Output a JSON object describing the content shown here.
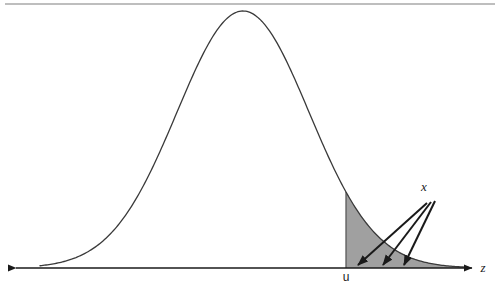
{
  "figure": {
    "title": "",
    "caption": "",
    "background_color": "#ffffff",
    "top_rule": {
      "name": "page-rule",
      "color": "#a8a8a8",
      "x_start": 5,
      "x_end": 495,
      "y": 4,
      "thickness": 1.4
    }
  },
  "labels": {
    "x_axis": "z",
    "threshold": "u",
    "tail_callout": "x"
  },
  "colors": {
    "curve": "#3a3a3a",
    "axis": "#1a1a1a",
    "shaded_region": "#a0a0a0",
    "shaded_region_edge": "#6f6f6f",
    "arrow": "#1a1a1a",
    "text": "#1a1a1a",
    "rule": "#a8a8a8"
  },
  "chart_data": {
    "type": "area",
    "xlabel": "z",
    "ylabel": "",
    "grid": false,
    "legend": null,
    "annotations": [
      {
        "name": "threshold-tick-label",
        "text": "u",
        "x_px": 346,
        "y_px": 281,
        "style": "upright"
      },
      {
        "name": "tail-callout-label",
        "text": "x",
        "x_px": 424,
        "y_px": 191,
        "style": "italic"
      },
      {
        "name": "x-axis-label",
        "text": "z",
        "x_px": 483,
        "y_px": 272,
        "style": "italic"
      }
    ],
    "distribution": {
      "name": "normal",
      "mean_px": 243,
      "sigma_px": 66,
      "peak_px": {
        "x": 243,
        "y": 11
      },
      "baseline_y_px": 268,
      "amplitude_px": 257,
      "domain_px": {
        "x_start": 40,
        "x_end": 468
      }
    },
    "shaded_tail": {
      "label": "upper tail area beyond u",
      "from_px": 346,
      "to_px": 468,
      "fill": "#a0a0a0",
      "z_threshold_sigma": 1.56
    },
    "axis_px": {
      "y": 268,
      "x_start": 12,
      "x_end": 472,
      "left_arrow": true,
      "right_arrow": true
    },
    "callout_arrows": [
      {
        "name": "callout-arrow-1",
        "x1": 427,
        "y1": 203,
        "x2": 358,
        "y2": 265
      },
      {
        "name": "callout-arrow-2",
        "x1": 431,
        "y1": 202,
        "x2": 383,
        "y2": 265
      },
      {
        "name": "callout-arrow-3",
        "x1": 435,
        "y1": 201,
        "x2": 404,
        "y2": 265
      }
    ],
    "x": [
      40,
      55,
      70,
      85,
      100,
      115,
      130,
      145,
      160,
      175,
      190,
      205,
      220,
      235,
      243,
      250,
      265,
      280,
      295,
      310,
      325,
      340,
      346,
      355,
      370,
      385,
      400,
      415,
      430,
      445,
      468
    ],
    "y": [
      268.0,
      267.8,
      267.3,
      266.2,
      264.0,
      260.0,
      253.3,
      242.7,
      227.1,
      205.8,
      178.9,
      148.1,
      116.1,
      87.3,
      78.0,
      72.5,
      66.3,
      75.9,
      100.1,
      134.9,
      175.1,
      214.3,
      228.0,
      235.5,
      249.8,
      259.1,
      264.2,
      266.6,
      267.6,
      268.0,
      268.0
    ]
  }
}
